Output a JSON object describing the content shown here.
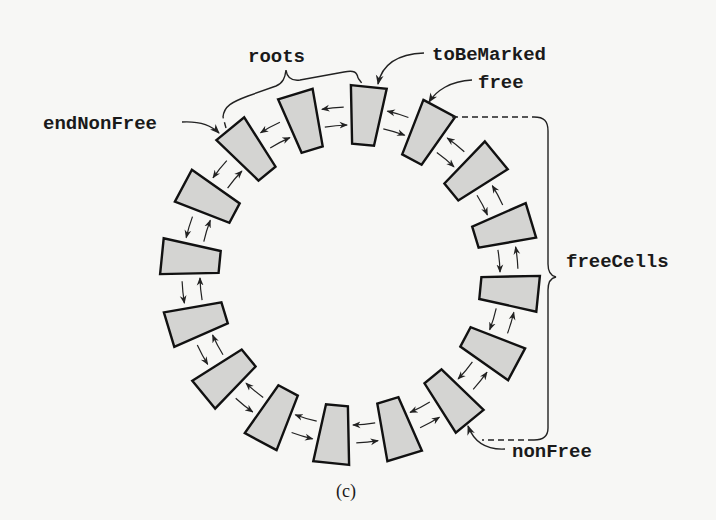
{
  "figure": {
    "caption": "(c)",
    "ring": {
      "cell_count": 16,
      "center": [
        350,
        275
      ],
      "outer_radius": 189,
      "inner_radius": 131,
      "outer_half_width": 18,
      "inner_half_width": 11,
      "start_angle_deg": 5.7,
      "link_radius_outer": 168,
      "link_radius_inner": 150,
      "cell_fill": "#d4d4d2",
      "stroke": "#111111"
    },
    "labels": {
      "roots": "roots",
      "toBeMarked": "toBeMarked",
      "free": "free",
      "endNonFree": "endNonFree",
      "freeCells": "freeCells",
      "nonFree": "nonFree"
    },
    "pointers": [
      {
        "name": "toBeMarked",
        "target_cell": 0
      },
      {
        "name": "free",
        "target_cell": 1
      },
      {
        "name": "nonFree",
        "target_cell": 6
      },
      {
        "name": "endNonFree",
        "target_cell": 14
      }
    ],
    "braces": [
      {
        "name": "roots",
        "from_cell": 15,
        "to_cell": 0
      },
      {
        "name": "freeCells",
        "from_cell": 1,
        "to_cell": 6
      }
    ]
  }
}
